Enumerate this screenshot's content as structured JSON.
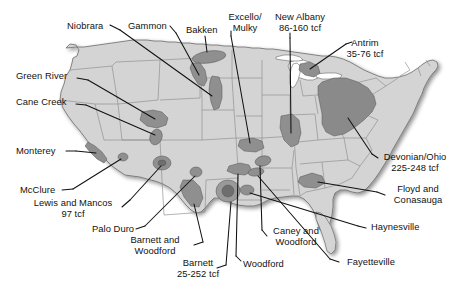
{
  "figure": {
    "kind": "map",
    "background_color": "#ffffff",
    "land_fill": "#d4d4d4",
    "basin_fill_dark": "#8f8f8f",
    "basin_fill_darker": "#737373",
    "outline_color": "#5a5a5a",
    "leader_line_color": "#111111",
    "text_color": "#121212"
  },
  "labels": [
    {
      "id": "niobrara",
      "text": "Niobrara",
      "lines": [
        "Niobrara"
      ],
      "x": 67,
      "y": 21,
      "align": "left"
    },
    {
      "id": "gammon",
      "text": "Gammon",
      "lines": [
        "Gammon"
      ],
      "x": 128,
      "y": 21,
      "align": "left"
    },
    {
      "id": "bakken",
      "text": "Bakken",
      "lines": [
        "Bakken"
      ],
      "x": 186,
      "y": 25,
      "align": "left"
    },
    {
      "id": "excello-mulky",
      "text": "Excello/ Mulky",
      "lines": [
        "Excello/",
        "Mulky"
      ],
      "x": 245,
      "y": 12,
      "align": "center"
    },
    {
      "id": "new-albany",
      "text": "New Albany 86-160 tcf",
      "lines": [
        "New Albany",
        "86-160 tcf"
      ],
      "x": 300,
      "y": 12,
      "align": "center"
    },
    {
      "id": "antrim",
      "text": "Antrim 35-76 tcf",
      "lines": [
        "Antrim",
        "35-76 tcf"
      ],
      "x": 365,
      "y": 38,
      "align": "center"
    },
    {
      "id": "green-river",
      "text": "Green River",
      "lines": [
        "Green River"
      ],
      "x": 16,
      "y": 71,
      "align": "left"
    },
    {
      "id": "cane-creek",
      "text": "Cane Creek",
      "lines": [
        "Cane Creek"
      ],
      "x": 16,
      "y": 97,
      "align": "left"
    },
    {
      "id": "monterey",
      "text": "Monterey",
      "lines": [
        "Monterey"
      ],
      "x": 16,
      "y": 146,
      "align": "left"
    },
    {
      "id": "mcclure",
      "text": "McClure",
      "lines": [
        "McClure"
      ],
      "x": 20,
      "y": 185,
      "align": "left"
    },
    {
      "id": "lewis-mancos",
      "text": "Lewis and Mancos 97 tcf",
      "lines": [
        "Lewis and Mancos",
        "97 tcf"
      ],
      "x": 73,
      "y": 203,
      "align": "center"
    },
    {
      "id": "palo-duro",
      "text": "Palo Duro",
      "lines": [
        "Palo Duro"
      ],
      "x": 92,
      "y": 224,
      "align": "left"
    },
    {
      "id": "barnett-woodford",
      "text": "Barnett and Woodford",
      "lines": [
        "Barnett and",
        "Woodford"
      ],
      "x": 155,
      "y": 240,
      "align": "center"
    },
    {
      "id": "barnett",
      "text": "Barnett 25-252 tcf",
      "lines": [
        "Barnett",
        "25-252 tcf"
      ],
      "x": 198,
      "y": 263,
      "align": "center"
    },
    {
      "id": "woodford",
      "text": "Woodford",
      "lines": [
        "Woodford"
      ],
      "x": 243,
      "y": 259,
      "align": "left"
    },
    {
      "id": "caney-woodford",
      "text": "Caney and Woodford",
      "lines": [
        "Caney and",
        "Woodford"
      ],
      "x": 296,
      "y": 228,
      "align": "center"
    },
    {
      "id": "fayetteville",
      "text": "Fayetteville",
      "lines": [
        "Fayetteville"
      ],
      "x": 347,
      "y": 257,
      "align": "left"
    },
    {
      "id": "haynesville",
      "text": "Haynesville",
      "lines": [
        "Haynesville"
      ],
      "x": 371,
      "y": 224,
      "align": "left"
    },
    {
      "id": "floyd-conasauga",
      "text": "Floyd and Conasauga",
      "lines": [
        "Floyd and",
        "Conasauga"
      ],
      "x": 420,
      "y": 188,
      "align": "center"
    },
    {
      "id": "devonian-ohio",
      "text": "Devonian/Ohio 225-248 tcf",
      "lines": [
        "Devonian/Ohio",
        "225-248 tcf"
      ],
      "x": 420,
      "y": 155,
      "align": "center"
    }
  ],
  "basins": [
    {
      "id": "bakken-basin",
      "name": "Bakken"
    },
    {
      "id": "gammon-basin",
      "name": "Gammon"
    },
    {
      "id": "niobrara-basin",
      "name": "Niobrara"
    },
    {
      "id": "green-river-basin",
      "name": "Green River"
    },
    {
      "id": "cane-creek-basin",
      "name": "Cane Creek"
    },
    {
      "id": "monterey-basin",
      "name": "Monterey"
    },
    {
      "id": "mcclure-basin",
      "name": "McClure"
    },
    {
      "id": "lewis-mancos-basin",
      "name": "Lewis and Mancos"
    },
    {
      "id": "palo-duro-basin",
      "name": "Palo Duro"
    },
    {
      "id": "barnett-basin",
      "name": "Barnett"
    },
    {
      "id": "barnett-woodford-basin",
      "name": "Barnett and Woodford"
    },
    {
      "id": "woodford-basin",
      "name": "Woodford"
    },
    {
      "id": "caney-woodford-basin",
      "name": "Caney and Woodford"
    },
    {
      "id": "fayetteville-basin",
      "name": "Fayetteville"
    },
    {
      "id": "haynesville-basin",
      "name": "Haynesville"
    },
    {
      "id": "floyd-conasauga-basin",
      "name": "Floyd and Conasauga"
    },
    {
      "id": "excello-mulky-basin",
      "name": "Excello/Mulky"
    },
    {
      "id": "new-albany-basin",
      "name": "New Albany"
    },
    {
      "id": "antrim-basin",
      "name": "Antrim"
    },
    {
      "id": "devonian-ohio-basin",
      "name": "Devonian/Ohio"
    }
  ]
}
